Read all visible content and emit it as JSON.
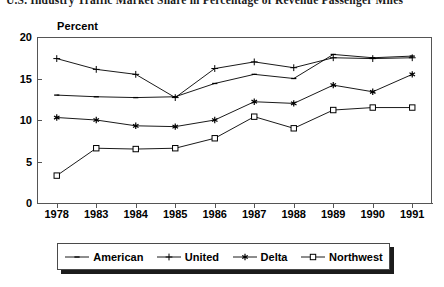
{
  "title": "U.S. Industry Traffic Market Share in Percentage of Revenue Passenger Miles",
  "axis": {
    "y_title": "Percent"
  },
  "legend": {
    "items": [
      {
        "label": "American",
        "marker": "dash-marker"
      },
      {
        "label": "United",
        "marker": "plus-marker"
      },
      {
        "label": "Delta",
        "marker": "star-marker"
      },
      {
        "label": "Northwest",
        "marker": "open-square-marker"
      }
    ]
  },
  "chart_data": {
    "type": "line",
    "title": "U.S. Industry Traffic Market Share in Percentage of Revenue Passenger Miles",
    "xlabel": "",
    "ylabel": "Percent",
    "categories": [
      "1978",
      "1983",
      "1984",
      "1985",
      "1986",
      "1987",
      "1988",
      "1989",
      "1990",
      "1991"
    ],
    "ylim": [
      0,
      20
    ],
    "yticks": [
      "0",
      "5",
      "10",
      "15",
      "20"
    ],
    "grid": false,
    "legend_position": "bottom",
    "series": [
      {
        "name": "American",
        "marker": "dash",
        "color": "#000000",
        "values": [
          13.0,
          12.8,
          12.7,
          12.8,
          14.4,
          15.5,
          15.0,
          17.9,
          17.5,
          17.7
        ]
      },
      {
        "name": "United",
        "marker": "plus",
        "color": "#000000",
        "values": [
          17.4,
          16.1,
          15.5,
          12.7,
          16.2,
          17.0,
          16.3,
          17.5,
          17.4,
          17.5
        ]
      },
      {
        "name": "Delta",
        "marker": "star",
        "color": "#000000",
        "values": [
          10.3,
          10.0,
          9.3,
          9.2,
          10.0,
          12.2,
          12.0,
          14.2,
          13.4,
          15.5
        ]
      },
      {
        "name": "Northwest",
        "marker": "open-square",
        "color": "#000000",
        "values": [
          3.3,
          6.6,
          6.5,
          6.6,
          7.8,
          10.4,
          9.0,
          11.2,
          11.5,
          11.5
        ]
      }
    ]
  }
}
